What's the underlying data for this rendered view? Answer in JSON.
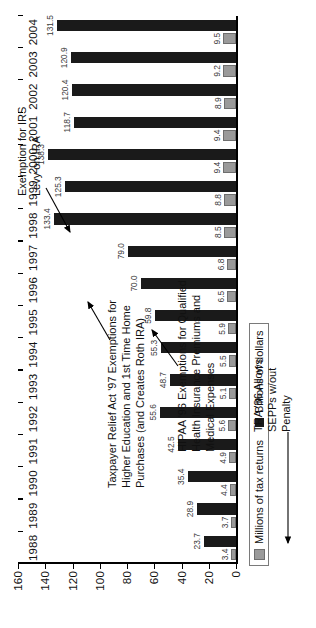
{
  "chart_data": {
    "type": "bar",
    "title": "",
    "xlabel": "",
    "ylabel": "",
    "ylim": [
      0,
      160
    ],
    "yticks": [
      0,
      20,
      40,
      60,
      80,
      100,
      120,
      140,
      160
    ],
    "grid": false,
    "legend_position": "top-left",
    "orientation": "rotated-90-ccw",
    "categories": [
      "1988",
      "1989",
      "1990",
      "1991",
      "1992",
      "1993",
      "1994",
      "1995",
      "1996",
      "1997",
      "1998",
      "1999",
      "2000",
      "2001",
      "2002",
      "2003",
      "2004"
    ],
    "series": [
      {
        "name": "Millions of tax returns",
        "color": "#9a9a9a",
        "values": [
          3.4,
          3.7,
          4.4,
          4.9,
          5.6,
          5.1,
          5.5,
          5.9,
          6.5,
          6.8,
          8.5,
          8.8,
          9.4,
          9.4,
          8.9,
          9.2,
          9.5
        ]
      },
      {
        "name": "Billions of dollars",
        "color": "#1a1a1a",
        "values": [
          23.7,
          28.9,
          35.4,
          42.5,
          55.6,
          48.7,
          55.3,
          59.8,
          70.0,
          79.0,
          133.4,
          125.3,
          138.3,
          118.7,
          120.4,
          120.9,
          131.5
        ]
      }
    ],
    "annotations": [
      {
        "id": "tra86",
        "text": "TRA '86 Allows\nSEPPs w/out\nPenalty",
        "points_to": "1988"
      },
      {
        "id": "hipaa",
        "text": "HIPAA '96 Exemptions for Qualified\nHealth Insurance Premiums and\nMedical Expenses",
        "points_to": "1997"
      },
      {
        "id": "trelief",
        "text": "Taxpayer Relief Act '97 Exemptions for\nHigher Education and 1st Time Home\nPurchases (and Creates Roth IRA)",
        "points_to": "1998"
      },
      {
        "id": "levy",
        "text": "Exemption for IRS\nLevy on IRA",
        "points_to": "2000"
      }
    ]
  },
  "legend": {
    "items": [
      {
        "label": "Millions of tax returns",
        "swatch": "returns-swatch"
      },
      {
        "label": "Billions of dollars",
        "swatch": "dollars-swatch"
      }
    ]
  }
}
